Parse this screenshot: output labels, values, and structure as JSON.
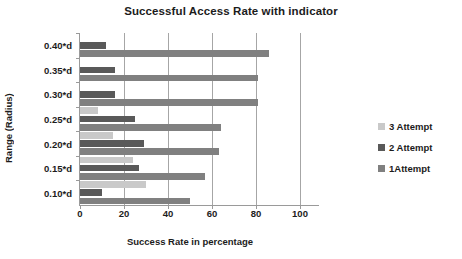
{
  "chart_data": {
    "type": "bar",
    "orientation": "horizontal",
    "title": "Successful Access Rate with indicator",
    "xlabel": "Success Rate in percentage",
    "ylabel": "Range (Radius)",
    "categories": [
      "0.10*d",
      "0.15*d",
      "0.20*d",
      "0.25*d",
      "0.30*d",
      "0.35*d",
      "0.40*d"
    ],
    "xlim": [
      0,
      100
    ],
    "xticks": [
      0,
      20,
      40,
      60,
      80,
      100
    ],
    "grid": true,
    "legend_position": "right",
    "series": [
      {
        "name": "3 Attempt",
        "color": "#c9c9c9",
        "values": [
          30,
          24,
          15,
          8,
          0,
          0,
          0
        ]
      },
      {
        "name": "2 Attempt",
        "color": "#595959",
        "values": [
          10,
          27,
          29,
          25,
          16,
          16,
          12
        ]
      },
      {
        "name": "1Attempt",
        "color": "#808080",
        "values": [
          50,
          57,
          63,
          64,
          81,
          81,
          86
        ]
      }
    ]
  },
  "legend": {
    "items": [
      {
        "label": "3 Attempt",
        "swatch": "s3"
      },
      {
        "label": "2 Attempt",
        "swatch": "s2"
      },
      {
        "label": "1Attempt",
        "swatch": "s1"
      }
    ]
  },
  "colors": {
    "series_3_attempt": "#c9c9c9",
    "series_2_attempt": "#595959",
    "series_1_attempt": "#808080",
    "gridline": "#a6a6a6",
    "axis": "#9a9a9a",
    "text": "#1c1c1c",
    "background": "#ffffff"
  }
}
